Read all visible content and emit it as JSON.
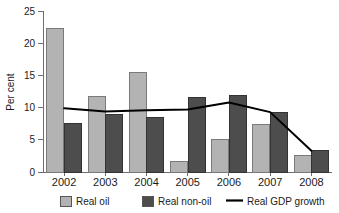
{
  "chart_data": {
    "type": "bar",
    "title": "",
    "xlabel": "",
    "ylabel": "Per cent",
    "categories": [
      "2002",
      "2003",
      "2004",
      "2005",
      "2006",
      "2007",
      "2008"
    ],
    "ylim": [
      0,
      25
    ],
    "yticks": [
      0,
      5,
      10,
      15,
      20,
      25
    ],
    "ytick_labels": [
      "0",
      "5",
      "10",
      "15",
      "20",
      "25"
    ],
    "grid": false,
    "legend_position": "bottom",
    "series": [
      {
        "name": "Real oil",
        "type": "bar",
        "color": "#b3b3b3",
        "values": [
          22.3,
          11.7,
          15.4,
          1.7,
          5.1,
          7.4,
          2.6
        ]
      },
      {
        "name": "Real non-oil",
        "type": "bar",
        "color": "#4d4d4d",
        "values": [
          7.6,
          8.9,
          8.5,
          11.5,
          11.9,
          9.2,
          3.3
        ]
      },
      {
        "name": "Real GDP growth",
        "type": "line",
        "color": "#000000",
        "values": [
          9.9,
          9.4,
          9.6,
          9.7,
          10.8,
          9.3,
          3.3
        ]
      }
    ]
  },
  "axis": {
    "y_title": "Per cent"
  },
  "legend": {
    "items": [
      {
        "label": "Real oil",
        "marker": "swatch",
        "color": "#b3b3b3"
      },
      {
        "label": "Real non-oil",
        "marker": "swatch",
        "color": "#4d4d4d"
      },
      {
        "label": "Real GDP growth",
        "marker": "line",
        "color": "#000000"
      }
    ]
  }
}
